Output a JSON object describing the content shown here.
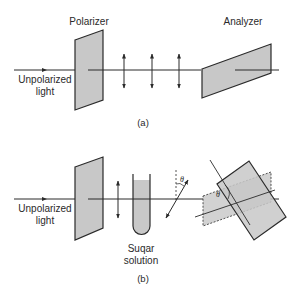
{
  "colors": {
    "line": "#2a2a2a",
    "fill": "#c8c8c8",
    "background": "#ffffff"
  },
  "part_a": {
    "caption": "(a)",
    "polarizer_label": "Polarizer",
    "analyzer_label": "Analyzer",
    "input_label_line1": "Unpolarized",
    "input_label_line2": "light",
    "polarization_arrows_count": 3
  },
  "part_b": {
    "caption": "(b)",
    "input_label_line1": "Unpolarized",
    "input_label_line2": "light",
    "sample_label_line1": "Suqar",
    "sample_label_line2": "solution",
    "rotation_angle_symbol": "θ",
    "analyzer_angle_symbol": "θ"
  }
}
